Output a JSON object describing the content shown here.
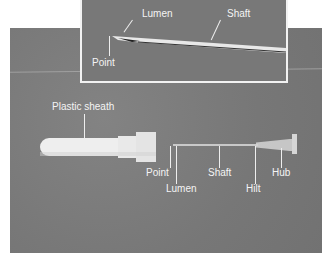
{
  "figure": {
    "colors": {
      "background": "#7b7b7b",
      "label": "#f4f4f4",
      "frame": "#f2f2f2"
    }
  },
  "inset": {
    "labels": {
      "lumen": "Lumen",
      "shaft": "Shaft",
      "point": "Point"
    }
  },
  "main": {
    "labels": {
      "plastic_sheath": "Plastic sheath",
      "point": "Point",
      "lumen": "Lumen",
      "shaft": "Shaft",
      "hilt": "Hilt",
      "hub": "Hub"
    }
  }
}
